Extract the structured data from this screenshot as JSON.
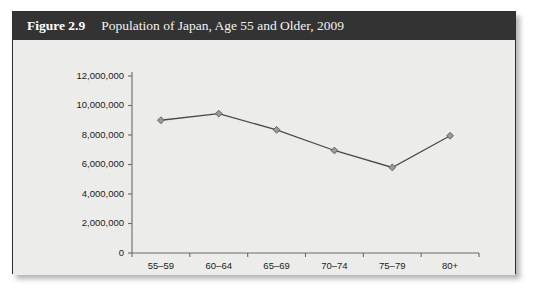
{
  "figure": {
    "number": "Figure 2.9",
    "title": "Population of Japan, Age 55 and Older, 2009"
  },
  "chart_data": {
    "type": "line",
    "title": "Population of Japan, Age 55 and Older, 2009",
    "xlabel": "",
    "ylabel": "",
    "categories": [
      "55–59",
      "60–64",
      "65–69",
      "70–74",
      "75–79",
      "80+"
    ],
    "values": [
      9000000,
      9450000,
      8350000,
      6950000,
      5800000,
      7950000
    ],
    "ylim": [
      0,
      12000000
    ],
    "ytick_values": [
      0,
      2000000,
      4000000,
      6000000,
      8000000,
      10000000,
      12000000
    ],
    "ytick_labels": [
      "0",
      "2,000,000",
      "4,000,000",
      "6,000,000",
      "8,000,000",
      "10,000,000",
      "12,000,000"
    ],
    "grid": false,
    "legend": false,
    "marker": "diamond",
    "line_color": "#4a4a4a",
    "marker_color": "#9a9a9a"
  },
  "style": {
    "caption_bg": "#333333",
    "caption_text": "#ffffff",
    "panel_bg": "#ececea",
    "border_color": "#2e2e2e"
  }
}
